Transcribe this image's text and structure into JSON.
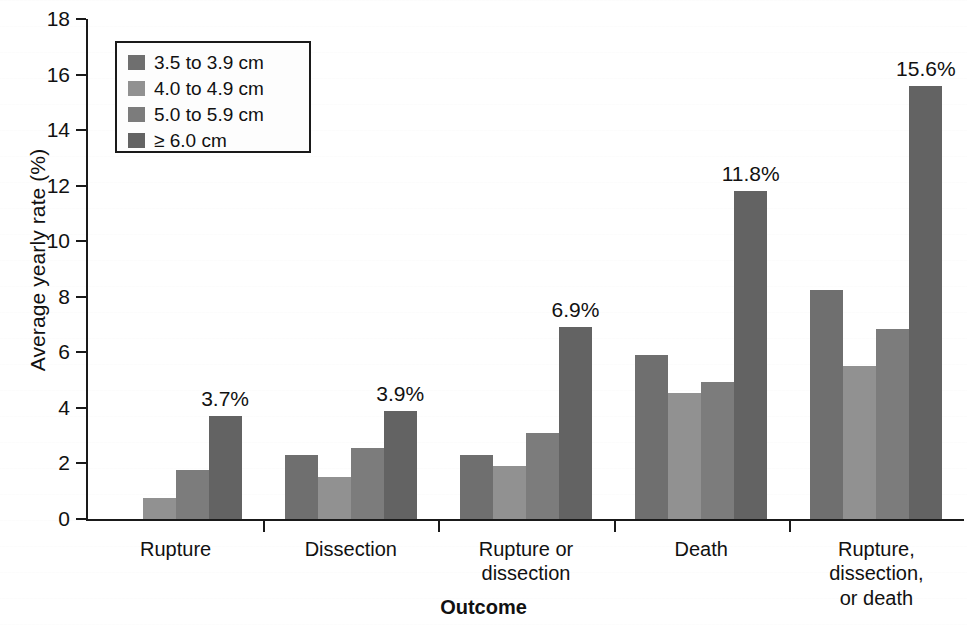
{
  "chart_data": {
    "type": "bar",
    "title": "",
    "xlabel": "Outcome",
    "ylabel": "Average yearly rate (%)",
    "ylim": [
      0,
      18
    ],
    "yticks": [
      0,
      2,
      4,
      6,
      8,
      10,
      12,
      14,
      16,
      18
    ],
    "grid": false,
    "legend_position": "top-left",
    "categories": [
      "Rupture",
      "Dissection",
      "Rupture or dissection",
      "Death",
      "Rupture, dissection, or death"
    ],
    "category_lines": [
      [
        "Rupture"
      ],
      [
        "Dissection"
      ],
      [
        "Rupture or",
        "dissection"
      ],
      [
        "Death"
      ],
      [
        "Rupture,",
        "dissection,",
        "or death"
      ]
    ],
    "series": [
      {
        "name": "3.5 to 3.9 cm",
        "color": "#6f6f6f",
        "values": [
          0.0,
          2.3,
          2.3,
          5.9,
          8.25
        ]
      },
      {
        "name": "4.0 to 4.9 cm",
        "color": "#919191",
        "values": [
          0.75,
          1.5,
          1.9,
          4.55,
          5.5
        ]
      },
      {
        "name": "5.0 to 5.9 cm",
        "color": "#7c7c7c",
        "values": [
          1.75,
          2.55,
          3.1,
          4.95,
          6.85
        ]
      },
      {
        "name": "≥ 6.0 cm",
        "color": "#636363",
        "values": [
          3.7,
          3.9,
          6.9,
          11.8,
          15.6
        ]
      }
    ],
    "annotations": [
      {
        "group": 0,
        "series": 3,
        "text": "3.7%"
      },
      {
        "group": 1,
        "series": 3,
        "text": "3.9%"
      },
      {
        "group": 2,
        "series": 3,
        "text": "6.9%"
      },
      {
        "group": 3,
        "series": 3,
        "text": "11.8%"
      },
      {
        "group": 4,
        "series": 3,
        "text": "15.6%"
      }
    ]
  },
  "legend": {
    "items": [
      {
        "label": "3.5 to 3.9 cm",
        "color": "#6f6f6f"
      },
      {
        "label": "4.0 to 4.9 cm",
        "color": "#919191"
      },
      {
        "label": "5.0 to 5.9 cm",
        "color": "#7c7c7c"
      },
      {
        "label": "≥ 6.0 cm",
        "color": "#636363"
      }
    ]
  },
  "axes": {
    "y_title": "Average yearly rate (%)",
    "x_title": "Outcome",
    "y_tick_labels": [
      "0",
      "2",
      "4",
      "6",
      "8",
      "10",
      "12",
      "14",
      "16",
      "18"
    ]
  }
}
